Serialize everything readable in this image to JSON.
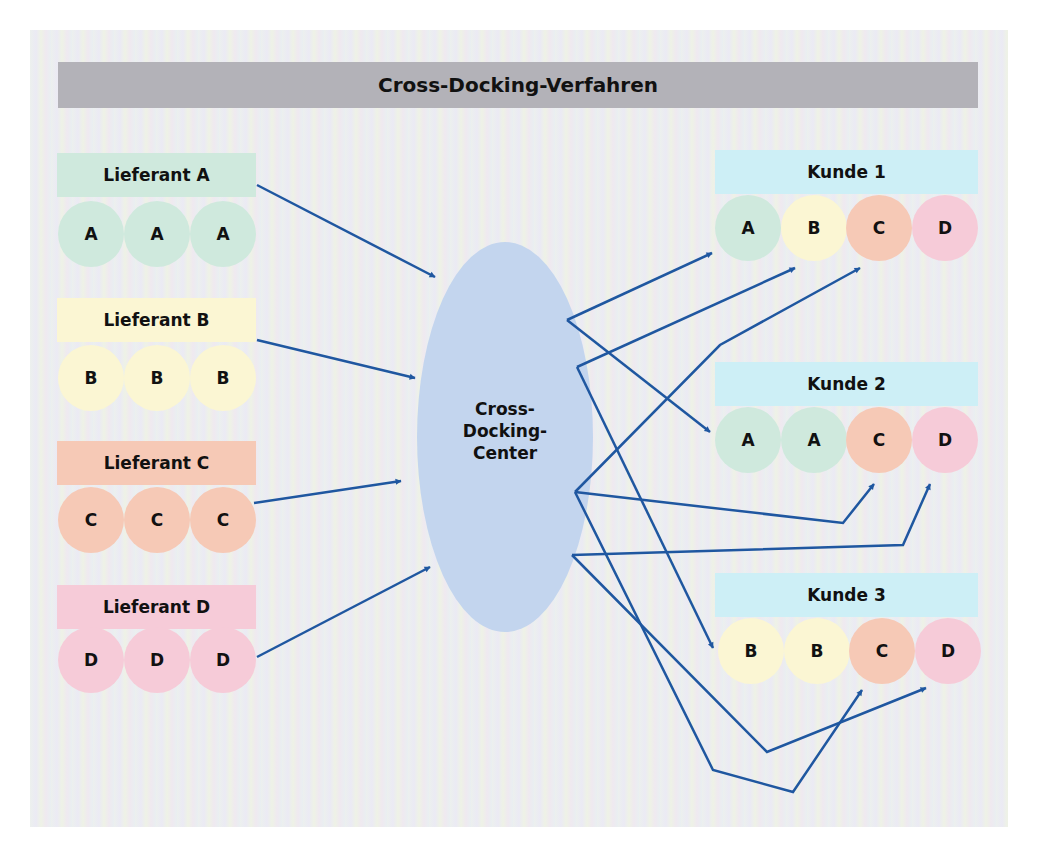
{
  "title": "Cross-Docking-Verfahren",
  "colors": {
    "A": "#cfe9dd",
    "B": "#fbf6d3",
    "C": "#f6c9b6",
    "D": "#f6cbd8",
    "customer_label": "#cdeff6",
    "center": "#c3d5ee",
    "arrow": "#1f57a0",
    "title_bar": "#b3b2b8"
  },
  "suppliers": [
    {
      "label": "Lieferant A",
      "key": "A",
      "items": [
        "A",
        "A",
        "A"
      ]
    },
    {
      "label": "Lieferant B",
      "key": "B",
      "items": [
        "B",
        "B",
        "B"
      ]
    },
    {
      "label": "Lieferant C",
      "key": "C",
      "items": [
        "C",
        "C",
        "C"
      ]
    },
    {
      "label": "Lieferant D",
      "key": "D",
      "items": [
        "D",
        "D",
        "D"
      ]
    }
  ],
  "center": {
    "lines": [
      "Cross-",
      "Docking-",
      "Center"
    ]
  },
  "customers": [
    {
      "label": "Kunde 1",
      "items": [
        "A",
        "B",
        "C",
        "D"
      ]
    },
    {
      "label": "Kunde 2",
      "items": [
        "A",
        "A",
        "C",
        "D"
      ]
    },
    {
      "label": "Kunde 3",
      "items": [
        "B",
        "B",
        "C",
        "D"
      ]
    }
  ]
}
